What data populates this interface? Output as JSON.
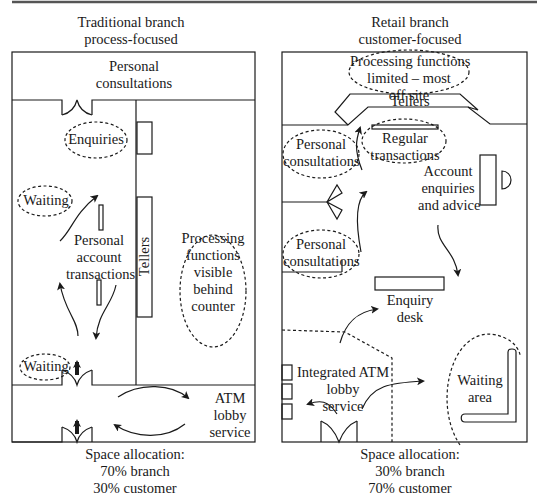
{
  "left": {
    "title": [
      "Traditional branch",
      "process-focused"
    ],
    "areas": {
      "personal_consultations": [
        "Personal",
        "consultations"
      ],
      "enquiries": "Enquiries",
      "waiting_upper": "Waiting",
      "personal_account_transactions": [
        "Personal",
        "account",
        "transactions"
      ],
      "tellers": "Tellers",
      "processing": [
        "Processing",
        "functions",
        "visible",
        "behind",
        "counter"
      ],
      "waiting_lower": "Waiting",
      "atm": [
        "ATM",
        "lobby",
        "service"
      ]
    },
    "space_allocation": [
      "Space allocation:",
      "70% branch",
      "30% customer"
    ]
  },
  "right": {
    "title": [
      "Retail branch",
      "customer-focused"
    ],
    "areas": {
      "processing": [
        "Processing functions",
        "limited – most",
        "off site"
      ],
      "tellers": "Tellers",
      "regular_transactions": [
        "Regular",
        "transactions"
      ],
      "personal_consultations_upper": [
        "Personal",
        "consultations"
      ],
      "personal_consultations_lower": [
        "Personal",
        "consultations"
      ],
      "account_enquiries": [
        "Account",
        "enquiries",
        "and advice"
      ],
      "enquiry_desk": [
        "Enquiry",
        "desk"
      ],
      "integrated_atm": [
        "Integrated ATM",
        "lobby",
        "service"
      ],
      "waiting_area": [
        "Waiting",
        "area"
      ]
    },
    "space_allocation": [
      "Space allocation:",
      "30% branch",
      "70% customer"
    ]
  },
  "colors": {
    "line": "#1a1a1a",
    "background": "#ffffff",
    "rule": "#555555"
  }
}
